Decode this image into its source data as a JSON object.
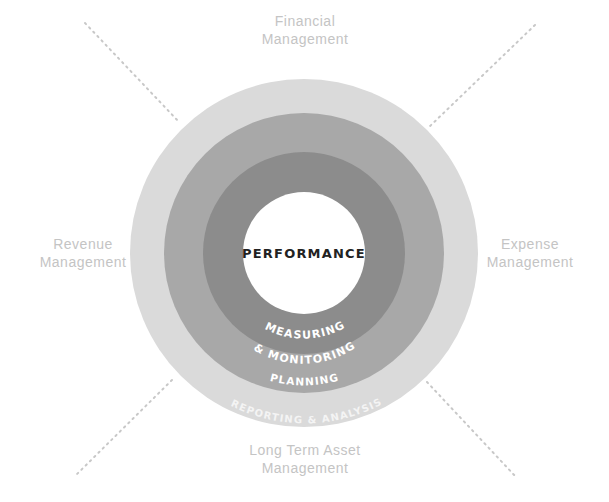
{
  "diagram": {
    "center_label": "PERFORMANCE",
    "rings": [
      {
        "id": "measuring",
        "label_line1": "MEASURING",
        "label_line2": "& MONITORING",
        "color": "#8c8c8c"
      },
      {
        "id": "planning",
        "label": "PLANNING",
        "color": "#a8a8a8"
      },
      {
        "id": "reporting",
        "label": "REPORTING & ANALYSIS",
        "color": "#dadada"
      }
    ],
    "center_color": "#ffffff",
    "outer_labels": {
      "top": {
        "line1": "Financial",
        "line2": "Management"
      },
      "left": {
        "line1": "Revenue",
        "line2": "Management"
      },
      "right": {
        "line1": "Expense",
        "line2": "Management"
      },
      "bottom": {
        "line1": "Long Term Asset",
        "line2": "Management"
      }
    },
    "label_color": "#c4c4c4",
    "dotted_line_color": "#c8c8c8"
  }
}
